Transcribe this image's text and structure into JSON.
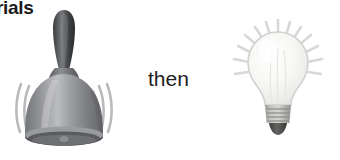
{
  "image": {
    "kind": "visual-schedule-illustration",
    "background_color": "#ffffff",
    "width": 340,
    "height": 160
  },
  "heading": {
    "cropped_text": "rials",
    "note_color": "#1b1b1b"
  },
  "sequence": {
    "connector_label": "then",
    "connector_color": "#222222",
    "first": {
      "icon_name": "hand-bell-icon",
      "label": "bell",
      "body_color": "#8f9093",
      "body_highlight": "#c9cacc",
      "body_shadow": "#6c6d70",
      "handle_color": "#3a3b3d",
      "handle_highlight": "#7a7b7e",
      "rim_color": "#5a5b5e",
      "motion_line_color": "#b9babc",
      "motion_lines_left": 3,
      "motion_lines_right": 3
    },
    "second": {
      "icon_name": "light-bulb-icon",
      "label": "light bulb",
      "glass_color": "#f2f2f0",
      "glass_highlight": "#fbfbfa",
      "glass_outline": "#d2d3d1",
      "base_color": "#b9bab6",
      "base_ridge_color": "#8e8f8c",
      "base_tip_color": "#4a4b49",
      "ray_color": "#d8d9d7",
      "ray_count": 13
    }
  }
}
